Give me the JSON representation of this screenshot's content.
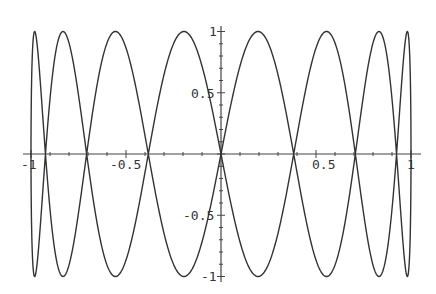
{
  "chart_data": {
    "type": "line",
    "subtype": "parametric-lissajous",
    "title": "",
    "xlabel": "",
    "ylabel": "",
    "parametric": {
      "x": "sin(t)",
      "y": "sin(8 t)",
      "t_range": [
        0,
        6.283185307
      ],
      "samples": 1200
    },
    "xlim": [
      -1,
      1
    ],
    "ylim": [
      -1,
      1
    ],
    "grid": false,
    "legend": null,
    "x_ticks": [
      {
        "value": -1,
        "label": "-1"
      },
      {
        "value": -0.5,
        "label": "-0.5"
      },
      {
        "value": 0.5,
        "label": "0.5"
      },
      {
        "value": 1,
        "label": "1"
      }
    ],
    "y_ticks": [
      {
        "value": 1,
        "label": "1"
      },
      {
        "value": 0.5,
        "label": "0.5"
      },
      {
        "value": -0.5,
        "label": "-0.5"
      },
      {
        "value": -1,
        "label": "-1"
      }
    ],
    "series": [
      {
        "name": "curve",
        "top_tangent_x": [
          -0.98,
          -0.83,
          -0.556,
          -0.195,
          0.195,
          0.556,
          0.83,
          0.98
        ],
        "bottom_tangent_x": [
          -0.98,
          -0.83,
          -0.556,
          -0.195,
          0.195,
          0.556,
          0.83,
          0.98
        ]
      }
    ]
  },
  "layout": {
    "origin_px": [
      221,
      154
    ],
    "x_unit_px": 190,
    "y_unit_px": 122.5,
    "x_axis_px": [
      23,
      421
    ],
    "y_axis_px": [
      26,
      282
    ],
    "colors": {
      "curve": "#333333",
      "axis": "#444444",
      "background": "#ffffff"
    }
  }
}
